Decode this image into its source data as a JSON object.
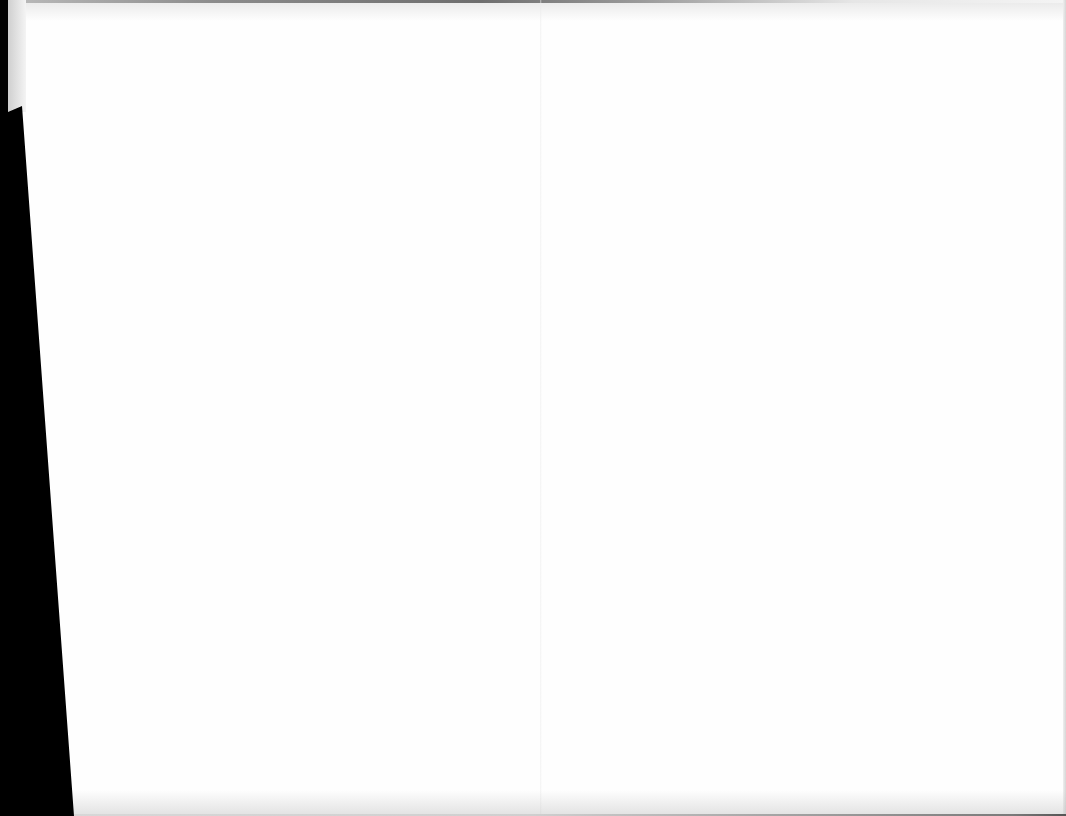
{
  "document": {
    "type": "scanned-page",
    "content": "",
    "colors": {
      "page": "#fefefe",
      "margin": "#000000",
      "edge_shadow": "#8c8c8c"
    }
  }
}
